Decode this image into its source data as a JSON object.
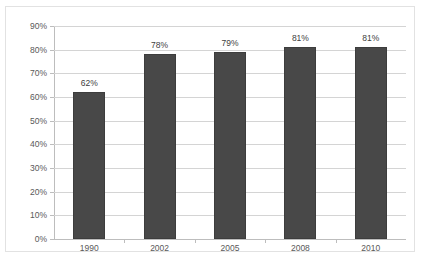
{
  "chart_data": {
    "type": "bar",
    "title": "",
    "subtitle": "",
    "xlabel": "",
    "ylabel": "",
    "categories": [
      "1990",
      "2002",
      "2005",
      "2008",
      "2010"
    ],
    "values": [
      62,
      78,
      79,
      81,
      81
    ],
    "value_labels": [
      "62%",
      "78%",
      "79%",
      "81%",
      "81%"
    ],
    "ylim": [
      0,
      90
    ],
    "ytick_labels": [
      "0%",
      "10%",
      "20%",
      "30%",
      "40%",
      "50%",
      "60%",
      "70%",
      "80%",
      "90%"
    ],
    "ytick_values": [
      0,
      10,
      20,
      30,
      40,
      50,
      60,
      70,
      80,
      90
    ],
    "grid": true,
    "legend": false,
    "colors": {
      "bar": "#484848",
      "bar_border": "#3d3d3d",
      "gridline": "#d4d4d4",
      "axis": "#bdbdbd",
      "frame": "#e2e2e2",
      "background": "#ffffff",
      "tick_text": "#595959",
      "value_text": "#404040"
    }
  }
}
